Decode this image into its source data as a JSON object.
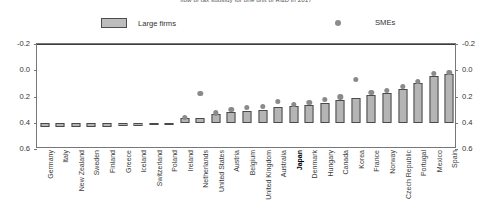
{
  "title": "flow of tax subsidy for one unit of R&D in 2017",
  "legend": {
    "items": [
      {
        "label": "Large firms",
        "marker": "bar-swatch",
        "color": "#bdbdbd"
      },
      {
        "label": "SMEs",
        "marker": "dot-swatch",
        "color": "#8c8c8c"
      }
    ]
  },
  "axis": {
    "y_ticks": [
      "0.6",
      "0.4",
      "0.2",
      "0.0",
      "-0.2"
    ],
    "y_ticks_right": [
      "0.6",
      "0.4",
      "0.2",
      "0.0",
      "-0.2"
    ]
  },
  "colors": {
    "bar_fill": "#b5b5b5",
    "bar_stroke": "#4a4a4a",
    "dot_fill": "#8a8a8a",
    "frame": "#777777",
    "zero_line": "#3d3d3d"
  },
  "highlight_category": "Japan",
  "chart_data": {
    "type": "bar",
    "title": "flow of tax subsidy for one unit of R&D in 2017",
    "xlabel": "",
    "ylabel": "",
    "ylim": [
      -0.2,
      0.6
    ],
    "yticks": [
      -0.2,
      0.0,
      0.2,
      0.4,
      0.6
    ],
    "grid": false,
    "legend_position": "top",
    "categories": [
      "Germany",
      "Italy",
      "New Zealand",
      "Sweden",
      "Finland",
      "Greece",
      "Iceland",
      "Switzerland",
      "Poland",
      "Ireland",
      "Netherlands",
      "United States",
      "Austria",
      "Belgium",
      "United Kingdom",
      "Australia",
      "Japan",
      "Denmark",
      "Hungary",
      "Canada",
      "Korea",
      "France",
      "Norway",
      "Czech Republic",
      "Portugal",
      "Mexico",
      "Spain"
    ],
    "series": [
      {
        "name": "Large firms",
        "type": "bar",
        "values": [
          -0.035,
          -0.035,
          -0.035,
          -0.035,
          -0.035,
          -0.025,
          -0.025,
          -0.02,
          -0.015,
          0.035,
          0.04,
          0.07,
          0.085,
          0.09,
          0.095,
          0.12,
          0.13,
          0.135,
          0.15,
          0.175,
          0.185,
          0.21,
          0.225,
          0.26,
          0.3,
          0.355,
          0.375
        ]
      },
      {
        "name": "SMEs",
        "type": "scatter",
        "values": [
          null,
          null,
          null,
          null,
          null,
          null,
          null,
          null,
          null,
          0.04,
          0.225,
          0.075,
          0.1,
          0.115,
          0.125,
          0.16,
          0.14,
          0.155,
          0.175,
          0.195,
          0.33,
          0.23,
          0.245,
          0.275,
          0.315,
          0.375,
          0.385
        ]
      }
    ]
  }
}
